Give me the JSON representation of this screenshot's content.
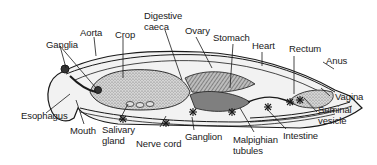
{
  "diagram": {
    "type": "anatomical-cross-section",
    "labels": {
      "aorta": "Aorta",
      "crop": "Crop",
      "digestive_caeca_1": "Digestive",
      "digestive_caeca_2": "caeca",
      "ovary": "Ovary",
      "stomach": "Stomach",
      "heart": "Heart",
      "rectum": "Rectum",
      "anus": "Anus",
      "ganglia": "Ganglia",
      "esophagus": "Esophagus",
      "mouth": "Mouth",
      "salivary_gland_1": "Salivary",
      "salivary_gland_2": "gland",
      "nerve_cord": "Nerve cord",
      "ganglion": "Ganglion",
      "malpighian_tubules_1": "Malpighian",
      "malpighian_tubules_2": "tubules",
      "intestine": "Intestine",
      "seminal_vesicle_1": "Seminal",
      "seminal_vesicle_2": "vesicle",
      "vagina": "Vagina"
    },
    "colors": {
      "ink": "#1a1a1a",
      "organ_fill": "#cfcfcf",
      "organ_dark": "#8a8a8a",
      "body_fill": "#f2f2f2"
    }
  }
}
